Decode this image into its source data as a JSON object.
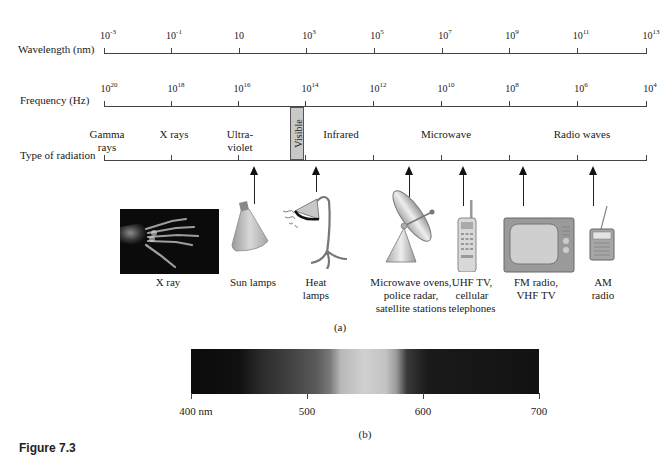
{
  "wavelength_axis": {
    "label": "Wavelength (nm)",
    "ticks": [
      {
        "base": "10",
        "exp": "-3"
      },
      {
        "base": "10",
        "exp": "-1"
      },
      {
        "base": "10",
        "exp": ""
      },
      {
        "base": "10",
        "exp": "3"
      },
      {
        "base": "10",
        "exp": "5"
      },
      {
        "base": "10",
        "exp": "7"
      },
      {
        "base": "10",
        "exp": "9"
      },
      {
        "base": "10",
        "exp": "11"
      },
      {
        "base": "10",
        "exp": "13"
      }
    ]
  },
  "frequency_axis": {
    "label": "Frequency (Hz)",
    "ticks": [
      {
        "base": "10",
        "exp": "20"
      },
      {
        "base": "10",
        "exp": "18"
      },
      {
        "base": "10",
        "exp": "16"
      },
      {
        "base": "10",
        "exp": "14"
      },
      {
        "base": "10",
        "exp": "12"
      },
      {
        "base": "10",
        "exp": "10"
      },
      {
        "base": "10",
        "exp": "8"
      },
      {
        "base": "10",
        "exp": "6"
      },
      {
        "base": "10",
        "exp": "4"
      }
    ]
  },
  "radiation_axis": {
    "label": "Type of radiation",
    "regions": [
      {
        "line1": "Gamma",
        "line2": "rays"
      },
      {
        "line1": "X rays",
        "line2": ""
      },
      {
        "line1": "Ultra-",
        "line2": "violet"
      },
      {
        "line1": "Visible",
        "line2": ""
      },
      {
        "line1": "Infrared",
        "line2": ""
      },
      {
        "line1": "Microwave",
        "line2": ""
      },
      {
        "line1": "Radio waves",
        "line2": ""
      }
    ]
  },
  "applications": [
    {
      "name": "x-ray",
      "line1": "X ray",
      "line2": "",
      "line3": ""
    },
    {
      "name": "sun-lamps",
      "line1": "Sun lamps",
      "line2": "",
      "line3": ""
    },
    {
      "name": "heat-lamps",
      "line1": "Heat",
      "line2": "lamps",
      "line3": ""
    },
    {
      "name": "microwave",
      "line1": "Microwave ovens,",
      "line2": "police radar,",
      "line3": "satellite stations"
    },
    {
      "name": "uhf-tv",
      "line1": "UHF TV,",
      "line2": "cellular",
      "line3": "telephones"
    },
    {
      "name": "fm-radio",
      "line1": "FM radio,",
      "line2": "VHF TV",
      "line3": ""
    },
    {
      "name": "am-radio",
      "line1": "AM",
      "line2": "radio",
      "line3": ""
    }
  ],
  "panel_a_label": "(a)",
  "visible_spectrum": {
    "ticks": [
      "400 nm",
      "500",
      "600",
      "700"
    ],
    "colors": {
      "dark": "#111111",
      "peak": "#d0d0d0"
    }
  },
  "panel_b_label": "(b)",
  "figure_label": "Figure 7.3"
}
